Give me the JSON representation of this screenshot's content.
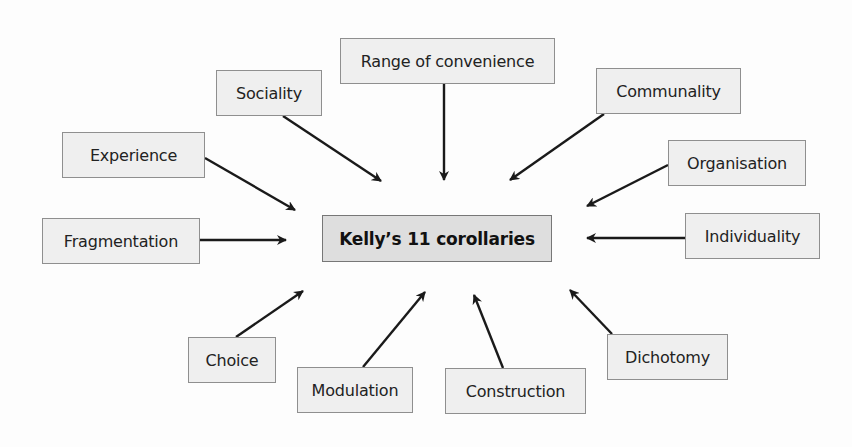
{
  "diagram": {
    "center": {
      "label": "Kelly’s 11 corollaries"
    },
    "nodes": [
      {
        "id": "range",
        "label": "Range of convenience"
      },
      {
        "id": "sociality",
        "label": "Sociality"
      },
      {
        "id": "communality",
        "label": "Communality"
      },
      {
        "id": "experience",
        "label": "Experience"
      },
      {
        "id": "organisation",
        "label": "Organisation"
      },
      {
        "id": "fragmentation",
        "label": "Fragmentation"
      },
      {
        "id": "individuality",
        "label": "Individuality"
      },
      {
        "id": "choice",
        "label": "Choice"
      },
      {
        "id": "dichotomy",
        "label": "Dichotomy"
      },
      {
        "id": "modulation",
        "label": "Modulation"
      },
      {
        "id": "construction",
        "label": "Construction"
      }
    ],
    "edges_direction": "all nodes point to center",
    "colors": {
      "box_fill": "#efefef",
      "center_fill": "#dedede",
      "border": "#8f8f8f",
      "arrow": "#1a1a1a"
    }
  }
}
